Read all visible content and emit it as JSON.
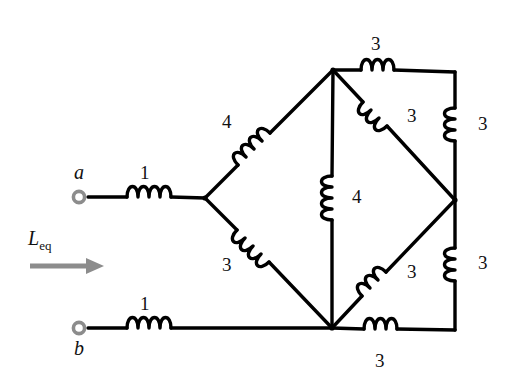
{
  "figure": {
    "type": "electrical-circuit-schematic",
    "line_color": "#000000",
    "arrow_color": "#808080",
    "terminal_color": "#808080",
    "background": "#ffffff"
  },
  "terminals": {
    "a": {
      "label": "a"
    },
    "b": {
      "label": "b"
    }
  },
  "equivalent": {
    "symbol": "L",
    "subscript": "eq"
  },
  "inductors": [
    {
      "id": "a-series",
      "value": "1",
      "orientation": "horizontal",
      "label_pos": "above"
    },
    {
      "id": "b-series",
      "value": "1",
      "orientation": "horizontal",
      "label_pos": "above"
    },
    {
      "id": "left-upper",
      "value": "4",
      "orientation": "diagonal-up",
      "label_pos": "left"
    },
    {
      "id": "left-lower",
      "value": "3",
      "orientation": "diagonal-down",
      "label_pos": "left"
    },
    {
      "id": "center-vertical",
      "value": "4",
      "orientation": "vertical",
      "label_pos": "right"
    },
    {
      "id": "top-horizontal",
      "value": "3",
      "orientation": "horizontal",
      "label_pos": "above"
    },
    {
      "id": "top-diagonal",
      "value": "3",
      "orientation": "diagonal-down",
      "label_pos": "right"
    },
    {
      "id": "right-upper",
      "value": "3",
      "orientation": "vertical",
      "label_pos": "right"
    },
    {
      "id": "bottom-diagonal",
      "value": "3",
      "orientation": "diagonal-up",
      "label_pos": "right"
    },
    {
      "id": "right-lower",
      "value": "3",
      "orientation": "vertical",
      "label_pos": "right"
    },
    {
      "id": "bottom-horizontal",
      "value": "3",
      "orientation": "horizontal",
      "label_pos": "below"
    }
  ],
  "labels": {
    "a": "a",
    "b": "b",
    "leq": "L",
    "leq_sub": "eq",
    "one_top": "1",
    "one_bottom": "1",
    "four_left": "4",
    "three_left": "3",
    "four_center": "4",
    "three_top": "3",
    "three_top_diag": "3",
    "three_right_upper": "3",
    "three_bottom_diag": "3",
    "three_right_lower": "3",
    "three_bottom": "3"
  }
}
